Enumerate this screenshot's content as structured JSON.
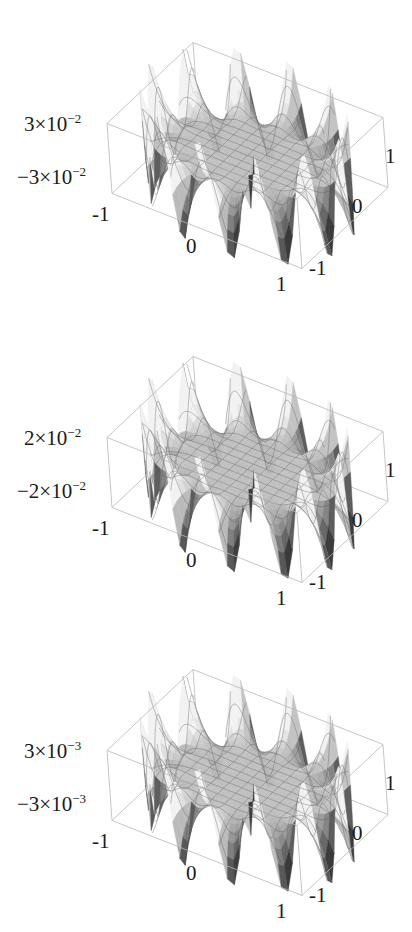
{
  "chart_data": [
    {
      "type": "surface3d",
      "title": "",
      "xlabel": "",
      "ylabel": "",
      "zlabel": "",
      "x_ticks": [
        "-1",
        "0",
        "1"
      ],
      "y_ticks": [
        "-1",
        "0",
        "1"
      ],
      "z_ticks": [
        "3×10^-2",
        "-3×10^-2"
      ],
      "z_tick_labels": {
        "top": {
          "mant": "3×10",
          "exp": "−2"
        },
        "bottom": {
          "mant": "−3×10",
          "exp": "−2"
        }
      },
      "xlim": [
        -1,
        1
      ],
      "ylim": [
        -1,
        1
      ],
      "zlim": [
        -0.03,
        0.03
      ],
      "surface": {
        "description": "oscillating ring near unit-circle boundary, flat center",
        "lobes": 12,
        "amplitude": 0.03,
        "radial_power": 8
      }
    },
    {
      "type": "surface3d",
      "title": "",
      "xlabel": "",
      "ylabel": "",
      "zlabel": "",
      "x_ticks": [
        "-1",
        "0",
        "1"
      ],
      "y_ticks": [
        "-1",
        "0",
        "1"
      ],
      "z_ticks": [
        "2×10^-2",
        "-2×10^-2"
      ],
      "z_tick_labels": {
        "top": {
          "mant": "2×10",
          "exp": "−2"
        },
        "bottom": {
          "mant": "−2×10",
          "exp": "−2"
        }
      },
      "xlim": [
        -1,
        1
      ],
      "ylim": [
        -1,
        1
      ],
      "zlim": [
        -0.02,
        0.02
      ],
      "surface": {
        "description": "oscillating ring near unit-circle boundary, flat center",
        "lobes": 12,
        "amplitude": 0.02,
        "radial_power": 8
      }
    },
    {
      "type": "surface3d",
      "title": "",
      "xlabel": "",
      "ylabel": "",
      "zlabel": "",
      "x_ticks": [
        "-1",
        "0",
        "1"
      ],
      "y_ticks": [
        "-1",
        "0",
        "1"
      ],
      "z_ticks": [
        "3×10^-3",
        "-3×10^-3"
      ],
      "z_tick_labels": {
        "top": {
          "mant": "3×10",
          "exp": "−3"
        },
        "bottom": {
          "mant": "−3×10",
          "exp": "−3"
        }
      },
      "xlim": [
        -1,
        1
      ],
      "ylim": [
        -1,
        1
      ],
      "zlim": [
        -0.003,
        0.003
      ],
      "surface": {
        "description": "oscillating ring near unit-circle boundary, flat center",
        "lobes": 12,
        "amplitude": 0.003,
        "radial_power": 8
      }
    }
  ],
  "style": {
    "box_color": "#b8b8b8",
    "mesh_color": "#555555",
    "surface_light": "#f2f2f2",
    "surface_dark": "#3a3a3a"
  }
}
